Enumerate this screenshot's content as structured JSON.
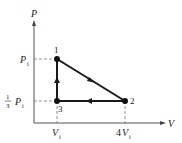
{
  "diagram": {
    "type": "pv-cycle",
    "axes": {
      "y_label": "P",
      "x_label": "V"
    },
    "ticks": {
      "y": [
        {
          "label_main": "P",
          "label_sub": "i",
          "meaning": "P_i"
        },
        {
          "label_frac_num": "1",
          "label_frac_den": "3",
          "label_main": "P",
          "label_sub": "i",
          "meaning": "1/3 P_i"
        }
      ],
      "x": [
        {
          "label_coef": "",
          "label_main": "V",
          "label_sub": "i",
          "meaning": "V_i"
        },
        {
          "label_coef": "4",
          "label_main": "V",
          "label_sub": "i",
          "meaning": "4V_i"
        }
      ]
    },
    "points": [
      {
        "id": "1",
        "label": "1",
        "V": "V_i",
        "P": "P_i"
      },
      {
        "id": "2",
        "label": "2",
        "V": "4V_i",
        "P": "1/3 P_i"
      },
      {
        "id": "3",
        "label": "3",
        "V": "V_i",
        "P": "1/3 P_i"
      }
    ],
    "paths": [
      {
        "from": "1",
        "to": "2",
        "kind": "straight line"
      },
      {
        "from": "2",
        "to": "3",
        "kind": "isobaric"
      },
      {
        "from": "3",
        "to": "1",
        "kind": "isochoric"
      }
    ],
    "colors": {
      "line": "#1a1a1a",
      "dash": "#777777"
    }
  }
}
